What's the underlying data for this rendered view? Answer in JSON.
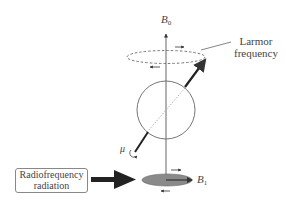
{
  "diagram": {
    "labels": {
      "b0": "B",
      "b0_sub": "0",
      "larmor_line1": "Larmor",
      "larmor_line2": "frequency",
      "mu": "μ",
      "b1": "B",
      "b1_sub": "1",
      "rf_line1": "Radiofrequency",
      "rf_line2": "radiation"
    },
    "colors": {
      "line": "#555555",
      "arrow": "#222222",
      "ellipse_fill": "#8a8a8a",
      "box_border": "#888888"
    }
  }
}
